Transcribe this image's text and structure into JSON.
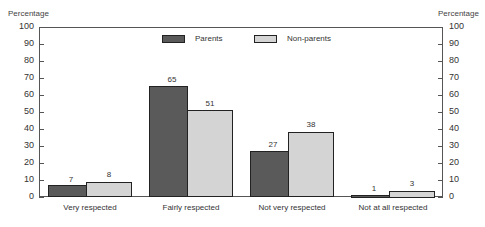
{
  "chart_data": {
    "type": "bar",
    "title": "",
    "xlabel": "",
    "ylabel": "Percentage",
    "ylabel_right": "Percentage",
    "ylim": [
      0,
      100
    ],
    "yticks": [
      0,
      10,
      20,
      30,
      40,
      50,
      60,
      70,
      80,
      90,
      100
    ],
    "grid": false,
    "legend_position": "top-center",
    "categories": [
      "Very respected",
      "Fairly respected",
      "Not very respected",
      "Not at all respected"
    ],
    "series": [
      {
        "name": "Parents",
        "color": "#5a5a5a",
        "values": [
          7,
          65,
          27,
          1
        ]
      },
      {
        "name": "Non-parents",
        "color": "#d4d4d4",
        "values": [
          8,
          51,
          38,
          3
        ]
      }
    ]
  },
  "axis": {
    "left_label": "Percentage",
    "right_label": "Percentage",
    "ticks": [
      "0",
      "10",
      "20",
      "30",
      "40",
      "50",
      "60",
      "70",
      "80",
      "90",
      "100"
    ]
  },
  "legend": {
    "parents": "Parents",
    "nonparents": "Non-parents"
  },
  "labels": {
    "cat0": "Very respected",
    "cat1": "Fairly respected",
    "cat2": "Not very respected",
    "cat3": "Not at all respected",
    "p0": "7",
    "n0": "8",
    "p1": "65",
    "n1": "51",
    "p2": "27",
    "n2": "38",
    "p3": "1",
    "n3": "3"
  }
}
